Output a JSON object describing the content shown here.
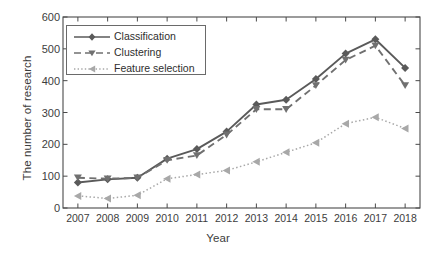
{
  "chart_data": {
    "type": "line",
    "title": "",
    "xlabel": "Year",
    "ylabel": "The number of research",
    "categories": [
      "2007",
      "2008",
      "2009",
      "2010",
      "2011",
      "2012",
      "2013",
      "2014",
      "2015",
      "2016",
      "2017",
      "2018"
    ],
    "x": [
      2007,
      2008,
      2009,
      2010,
      2011,
      2012,
      2013,
      2014,
      2015,
      2016,
      2017,
      2018
    ],
    "xlim": [
      2006.5,
      2018.5
    ],
    "ylim": [
      0,
      600
    ],
    "yticks": [
      0,
      100,
      200,
      300,
      400,
      500,
      600
    ],
    "xticks": [
      "2007",
      "2008",
      "2009",
      "2010",
      "2011",
      "2012",
      "2013",
      "2014",
      "2015",
      "2016",
      "2017",
      "2018"
    ],
    "grid": false,
    "legend_position": "upper-left-inside",
    "series": [
      {
        "name": "Classification",
        "linestyle": "solid",
        "marker": "diamond",
        "color": "#5a5a5a",
        "values": [
          80,
          90,
          95,
          155,
          185,
          240,
          325,
          340,
          405,
          485,
          530,
          440
        ]
      },
      {
        "name": "Clustering",
        "linestyle": "dashed",
        "marker": "triangle-down",
        "color": "#707070",
        "values": [
          95,
          92,
          95,
          150,
          165,
          230,
          310,
          310,
          385,
          465,
          510,
          385
        ]
      },
      {
        "name": "Feature selection",
        "linestyle": "dotted",
        "marker": "triangle-left",
        "color": "#a8a8a8",
        "values": [
          38,
          30,
          40,
          92,
          105,
          118,
          145,
          175,
          205,
          265,
          285,
          250
        ]
      }
    ]
  },
  "legend": {
    "entries": [
      {
        "label": "Classification"
      },
      {
        "label": "Clustering"
      },
      {
        "label": "Feature selection"
      }
    ]
  },
  "colors": {
    "axis": "#4a4a4a",
    "background": "#ffffff",
    "text": "#3d3d3d"
  }
}
